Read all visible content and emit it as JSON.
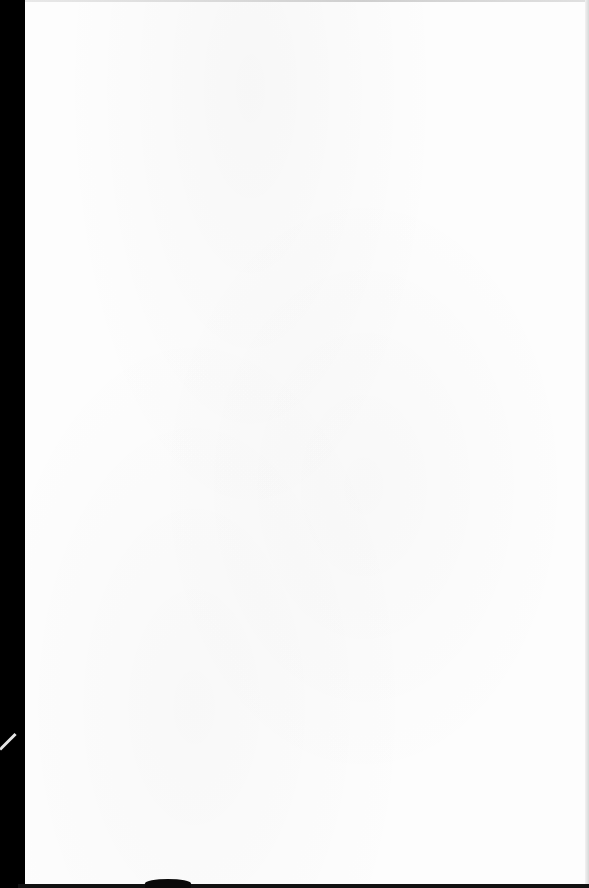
{
  "document": {
    "type": "scanned-page",
    "content": "blank",
    "visible_text": [],
    "colors": {
      "paper": "#fdfdfd",
      "border": "#000000"
    }
  }
}
